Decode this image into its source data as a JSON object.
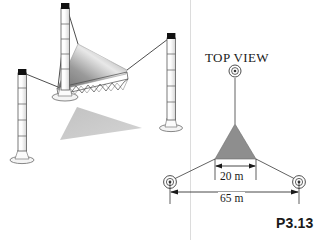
{
  "figure": {
    "problem_id": "P3.13",
    "background_color": "#ffffff",
    "line_color": "#1a1a1a"
  },
  "perspective_view": {
    "name": "tensile sail structure perspective",
    "masts": [
      {
        "id": "mast-left",
        "label": "left mast"
      },
      {
        "id": "mast-center",
        "label": "center mast"
      },
      {
        "id": "mast-right",
        "label": "right mast"
      }
    ],
    "sail": {
      "fill_light": "#f2f2f2",
      "fill_mid": "#a9a9a9",
      "fill_dark": "#6f6f6f"
    },
    "shadow": {
      "fill": "#c9c9c9"
    },
    "truss": {
      "label": "lattice edge beam"
    }
  },
  "top_view": {
    "title": "TOP VIEW",
    "triangle_fill": "#8e8e8e",
    "anchors": [
      {
        "id": "anchor-top",
        "label": "top anchor"
      },
      {
        "id": "anchor-bottom-left",
        "label": "bottom left anchor"
      },
      {
        "id": "anchor-bottom-right",
        "label": "bottom right anchor"
      }
    ],
    "dimensions": [
      {
        "id": "dim-20",
        "value": "20 m"
      },
      {
        "id": "dim-65",
        "value": "65 m"
      }
    ]
  }
}
